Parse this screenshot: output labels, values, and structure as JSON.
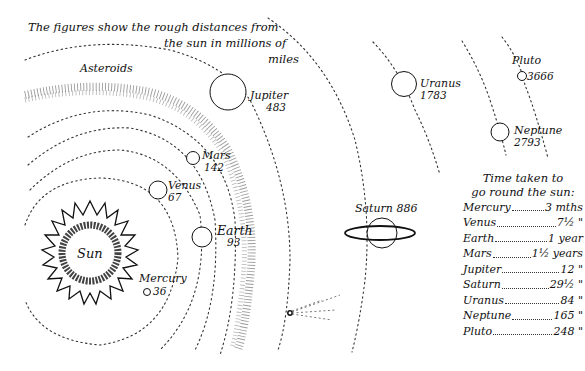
{
  "caption": {
    "line1": "The figures show the rough distances from",
    "line2": "the sun in millions of",
    "line3": "miles"
  },
  "sun": {
    "label": "Sun"
  },
  "asteroids": {
    "label": "Asteroids"
  },
  "planets": [
    {
      "name": "Mercury",
      "distance": "36"
    },
    {
      "name": "Venus",
      "distance": "67"
    },
    {
      "name": "Earth",
      "distance": "93"
    },
    {
      "name": "Mars",
      "distance": "142"
    },
    {
      "name": "Jupiter",
      "distance": "483"
    },
    {
      "name": "Saturn",
      "distance": "886"
    },
    {
      "name": "Uranus",
      "distance": "1783"
    },
    {
      "name": "Neptune",
      "distance": "2793"
    },
    {
      "name": "Pluto",
      "distance": "3666"
    }
  ],
  "orbit_table": {
    "heading_line1": "Time taken to",
    "heading_line2": "go round the sun:",
    "rows": [
      {
        "planet": "Mercury",
        "period": "3 mths"
      },
      {
        "planet": "Venus",
        "period": "7½  \""
      },
      {
        "planet": "Earth",
        "period": "1 year"
      },
      {
        "planet": "Mars",
        "period": "1½ years"
      },
      {
        "planet": "Jupiter",
        "period": "12   \""
      },
      {
        "planet": "Saturn",
        "period": "29½  \""
      },
      {
        "planet": "Uranus",
        "period": "84   \""
      },
      {
        "planet": "Neptune",
        "period": "165  \""
      },
      {
        "planet": "Pluto",
        "period": "248  \""
      }
    ]
  },
  "colors": {
    "ink": "#111111",
    "paper": "#ffffff"
  }
}
